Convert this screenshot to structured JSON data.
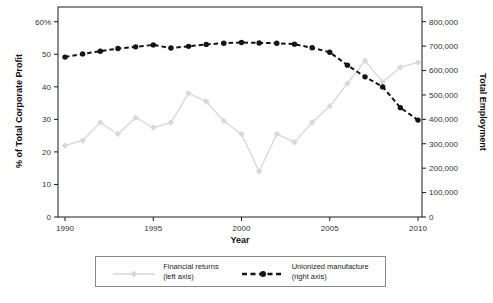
{
  "colors": {
    "background": "#ffffff",
    "frame": "#1a1a1a",
    "tick_text": "#333333",
    "financial_series": "#d9d9d9",
    "union_series": "#141414"
  },
  "axis_titles": {
    "left": "% of Total Corporate Profit",
    "right": "Total Employment",
    "x": "Year"
  },
  "legend": {
    "items": [
      {
        "line1": "Financial returns",
        "line2": "(left axis)"
      },
      {
        "line1": "Unionized manufacture",
        "line2": "(right axis)"
      }
    ]
  },
  "chart_data": {
    "type": "line",
    "title": "",
    "xlabel": "Year",
    "grid": false,
    "legend_position": "bottom",
    "x": [
      1990,
      1991,
      1992,
      1993,
      1994,
      1995,
      1996,
      1997,
      1998,
      1999,
      2000,
      2001,
      2002,
      2003,
      2004,
      2005,
      2006,
      2007,
      2008,
      2009,
      2010
    ],
    "x_ticks": {
      "values": [
        1990,
        1995,
        2000,
        2005,
        2010
      ],
      "labels": [
        "1990",
        "1995",
        "2000",
        "2005",
        "2010"
      ]
    },
    "left_axis": {
      "label": "% of Total Corporate Profit",
      "range": [
        0,
        60
      ],
      "tick_values": [
        0,
        10,
        20,
        30,
        40,
        50,
        60
      ],
      "tick_labels": [
        "0",
        "10",
        "20",
        "30",
        "40",
        "50",
        "60%"
      ]
    },
    "right_axis": {
      "label": "Total Employment",
      "range": [
        0,
        800000
      ],
      "tick_values": [
        0,
        100000,
        200000,
        300000,
        400000,
        500000,
        600000,
        700000,
        800000
      ],
      "tick_labels": [
        "0",
        "100,000",
        "200,000",
        "300,000",
        "400,000",
        "500,000",
        "600,000",
        "700,000",
        "800,000"
      ]
    },
    "series": [
      {
        "name": "Financial returns (left axis)",
        "axis": "left",
        "style": "solid",
        "marker": "diamond",
        "color": "#d9d9d9",
        "values": [
          22,
          23.5,
          29,
          25.5,
          30.5,
          27.5,
          29,
          38,
          35.5,
          29.5,
          25.5,
          14,
          25.5,
          23,
          29,
          34,
          41,
          48,
          41.5,
          46,
          47.5
        ]
      },
      {
        "name": "Unionized manufacture (right axis)",
        "axis": "right",
        "style": "dashed",
        "marker": "circle",
        "color": "#141414",
        "values": [
          655000,
          668000,
          679000,
          690000,
          697000,
          705000,
          692000,
          699000,
          707000,
          712000,
          715000,
          713000,
          712000,
          708000,
          693000,
          675000,
          622000,
          574000,
          533000,
          448000,
          397000
        ]
      }
    ]
  }
}
